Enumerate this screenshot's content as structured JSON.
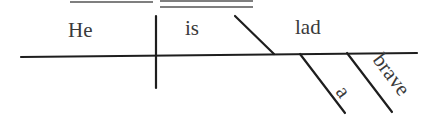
{
  "diagram": {
    "type": "sentence-diagram",
    "sentence": "He is a brave lad",
    "subject": "He",
    "verb": "is",
    "predicate_nominative": "lad",
    "modifiers": [
      "a",
      "brave"
    ]
  },
  "colors": {
    "background": "#ffffff",
    "line": "#1e1e1e",
    "text": "#3a3a3a"
  }
}
